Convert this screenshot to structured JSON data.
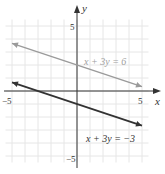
{
  "chart_data": {
    "type": "line",
    "title": "",
    "xlabel": "x",
    "ylabel": "y",
    "xlim": [
      -5.5,
      5.5
    ],
    "ylim": [
      -5.5,
      5.5
    ],
    "grid": true,
    "x_tick_labels": [
      "-5",
      "5"
    ],
    "y_tick_labels": [
      "5",
      "-5"
    ],
    "series": [
      {
        "name": "x + 3y = 6",
        "equation": "x + 3y = 6",
        "color": "#9a9a9a",
        "x": [
          -5,
          5
        ],
        "y": [
          3.667,
          0.333
        ]
      },
      {
        "name": "x + 3y = -3",
        "equation": "x + 3y = -3",
        "color": "#333333",
        "x": [
          -5,
          5
        ],
        "y": [
          0.667,
          -2.667
        ]
      }
    ],
    "annotations": [
      {
        "text": "x + 3y = 6",
        "x": 1.2,
        "y": 2.0
      },
      {
        "text": "x + 3y = −3",
        "x": 1.2,
        "y": -3.7
      }
    ]
  },
  "labels": {
    "x_axis": "x",
    "y_axis": "y",
    "x_min": "−5",
    "x_max": "5",
    "y_max": "5",
    "y_min": "−5",
    "line1": "x + 3y = 6",
    "line2": "x + 3y = −3"
  }
}
